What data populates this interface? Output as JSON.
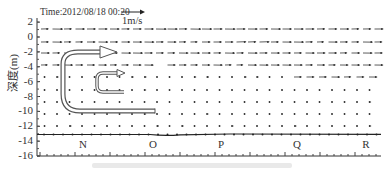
{
  "chart_data": {
    "type": "quiver",
    "title": "Time:2012/08/18  00:20",
    "scale_label": "1m/s",
    "xlabel": "",
    "ylabel": "深度(m)",
    "ylim": [
      -16,
      2.5
    ],
    "yticks": [
      "2",
      "0",
      "-2",
      "-4",
      "-6",
      "-8",
      "-10",
      "-12",
      "-14",
      "-16"
    ],
    "x_stations": [
      "N",
      "O",
      "P",
      "Q",
      "R"
    ],
    "seabed_depth_m": -13.5,
    "vector_rows": [
      {
        "depth": 1.0,
        "u_mean": 0.65,
        "note": "eastward flow, uniform"
      },
      {
        "depth": -0.5,
        "u_mean": 0.6,
        "note": "eastward flow"
      },
      {
        "depth": -2.0,
        "u_mean": 0.6,
        "note": "eastward flow"
      },
      {
        "depth": -4.0,
        "u_mean": 0.55,
        "note": "eastward flow, partly gapped"
      },
      {
        "depth": -5.5,
        "u_mean": 0.1,
        "note": "weak, stronger eastward near right"
      },
      {
        "depth": -7.5,
        "u_mean": 0.05,
        "note": "near zero"
      },
      {
        "depth": -9.0,
        "u_mean": 0.05,
        "note": "near zero"
      },
      {
        "depth": -10.5,
        "u_mean": 0.05,
        "note": "near zero"
      },
      {
        "depth": -12.0,
        "u_mean": 0.08,
        "note": "near zero"
      }
    ],
    "annotations": [
      {
        "type": "large-curved-arrow",
        "description": "U-shaped flow from bottom (-10 m) rising to surface layer (-2 m), pointing east"
      },
      {
        "type": "small-curved-arrow",
        "description": "U-shaped flow from -8 m rising to -5 m, pointing east"
      }
    ],
    "grid": false,
    "legend": "none"
  },
  "labels": {
    "title": "Time:2012/08/18  00:20",
    "scale": "1m/s",
    "ylabel": "深度(m)",
    "yticks": [
      "2",
      "0",
      "-2",
      "-4",
      "-6",
      "-8",
      "-10",
      "-12",
      "-14",
      "-16"
    ],
    "stations": [
      "N",
      "O",
      "P",
      "Q",
      "R"
    ]
  }
}
